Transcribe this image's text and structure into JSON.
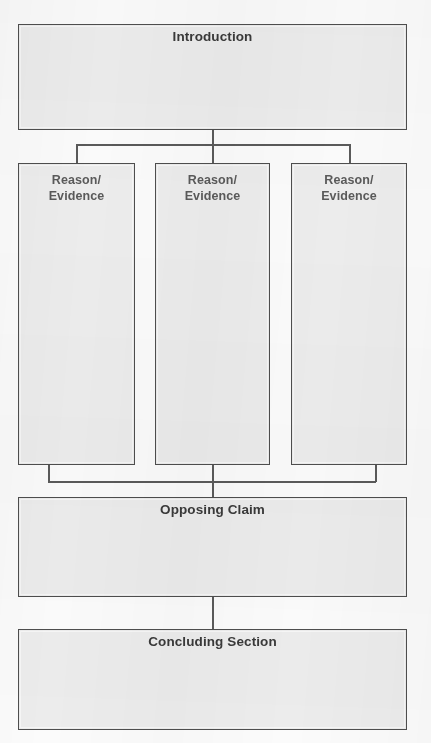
{
  "diagram": {
    "fill_color": "#ececec",
    "border_color": "#4e4e4e",
    "line_color": "#5a5a5a",
    "page_background": "#fbfbfb",
    "heading_text_color": "#3a3a3a",
    "column_text_color": "#5a5a5a",
    "nodes": {
      "introduction": {
        "label": "Introduction"
      },
      "reason_1": {
        "line1": "Reason/",
        "line2": "Evidence"
      },
      "reason_2": {
        "line1": "Reason/",
        "line2": "Evidence"
      },
      "reason_3": {
        "line1": "Reason/",
        "line2": "Evidence"
      },
      "opposing_claim": {
        "label": "Opposing Claim"
      },
      "concluding_section": {
        "label": "Concluding Section"
      }
    }
  }
}
